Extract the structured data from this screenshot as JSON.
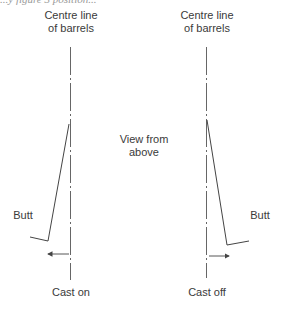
{
  "figure": {
    "cropped_caption": "...y figure 3 position...",
    "left": {
      "centre_label_line1": "Centre line",
      "centre_label_line2": "of barrels",
      "butt_label": "Butt",
      "bottom_label": "Cast on"
    },
    "middle_label_line1": "View from",
    "middle_label_line2": "above",
    "right": {
      "centre_label_line1": "Centre line",
      "centre_label_line2": "of barrels",
      "butt_label": "Butt",
      "bottom_label": "Cast off"
    },
    "line_color": "#444444"
  }
}
